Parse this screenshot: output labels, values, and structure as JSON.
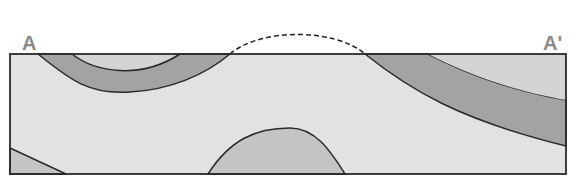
{
  "diagram": {
    "type": "geologic-cross-section",
    "labels": {
      "start": "A",
      "end": "A'"
    },
    "colors": {
      "background_rock": "#e2e2e2",
      "dark_layer": "#a3a3a3",
      "medium_layer": "#c4c4c4",
      "outline": "#2a2a2a",
      "label": "#8a8a8a"
    },
    "features": [
      {
        "name": "dark-folded-layer",
        "description": "syncline band on the left and dipping band on the right"
      },
      {
        "name": "eroded-anticline-crest",
        "description": "dashed arc above surface showing eroded fold"
      },
      {
        "name": "lower-layer-dome",
        "description": "anticlinal core exposed at bottom center"
      },
      {
        "name": "lower-layer-wedge",
        "description": "lower layer at bottom-left corner"
      }
    ]
  }
}
